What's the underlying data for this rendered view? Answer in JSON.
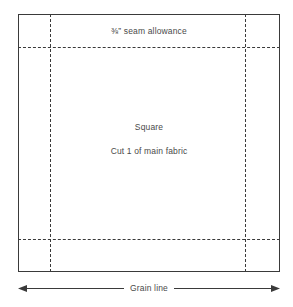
{
  "diagram": {
    "background_color": "#ffffff",
    "stroke_color": "#3a3a3a",
    "text_color": "#4a4a4a"
  },
  "piece": {
    "outline_name": "cut-line",
    "labels": {
      "seam_allowance_fraction": "⅜",
      "seam_allowance": "” seam allowance",
      "seam_allowance_full": "⅜” seam allowance",
      "piece_name": "Square",
      "cut_instruction": "Cut 1 of main fabric"
    }
  },
  "seam_lines": {
    "description": "dashed stitching guides inset from the cut edge",
    "vertical_left_label": "seam-line-left",
    "vertical_right_label": "seam-line-right",
    "horizontal_top_label": "seam-line-top",
    "horizontal_bottom_label": "seam-line-bottom"
  },
  "grainline": {
    "label": "Grain line",
    "direction": "horizontal",
    "arrow_style": "double-headed"
  }
}
